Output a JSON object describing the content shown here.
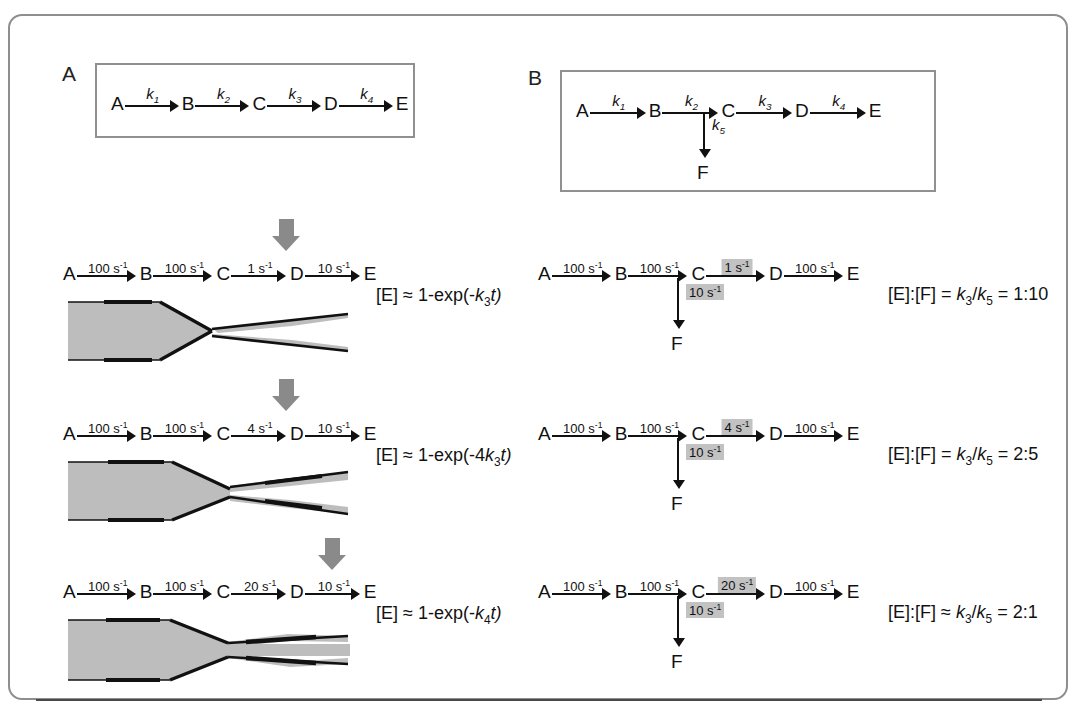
{
  "figure": {
    "panels": [
      {
        "letter": "A",
        "scheme": {
          "species": [
            "A",
            "B",
            "C",
            "D",
            "E"
          ],
          "rates": [
            "k1",
            "k2",
            "k3",
            "k4"
          ],
          "rate_labels": [
            "k",
            "k",
            "k",
            "k"
          ],
          "rate_subs": [
            "1",
            "2",
            "3",
            "4"
          ]
        },
        "rows": [
          {
            "rates": [
              "100 s",
              "100 s",
              "1 s",
              "10 s"
            ],
            "exponent": "-1",
            "species": [
              "A",
              "B",
              "C",
              "D",
              "E"
            ],
            "highlight_index": 2,
            "equation_prefix": "[E] ≈ 1-exp(-",
            "equation_k": "k",
            "equation_sub": "3",
            "equation_suffix": "t)"
          },
          {
            "rates": [
              "100 s",
              "100 s",
              "4 s",
              "10 s"
            ],
            "exponent": "-1",
            "species": [
              "A",
              "B",
              "C",
              "D",
              "E"
            ],
            "highlight_index": 2,
            "equation_prefix": "[E] ≈ 1-exp(-4",
            "equation_k": "k",
            "equation_sub": "3",
            "equation_suffix": "t)"
          },
          {
            "rates": [
              "100 s",
              "100 s",
              "20 s",
              "10 s"
            ],
            "exponent": "-1",
            "species": [
              "A",
              "B",
              "C",
              "D",
              "E"
            ],
            "highlight_index": 3,
            "equation_prefix": "[E] ≈ 1-exp(-",
            "equation_k": "k",
            "equation_sub": "4",
            "equation_suffix": "t)"
          }
        ]
      },
      {
        "letter": "B",
        "scheme": {
          "species": [
            "A",
            "B",
            "C",
            "D",
            "E"
          ],
          "branch_species": "F",
          "rate_labels": [
            "k",
            "k",
            "k",
            "k"
          ],
          "rate_subs": [
            "1",
            "2",
            "3",
            "4"
          ],
          "branch_label": "k",
          "branch_sub": "5"
        },
        "rows": [
          {
            "rates": [
              "100 s",
              "100 s",
              "1 s",
              "100 s"
            ],
            "exponent": "-1",
            "species": [
              "A",
              "B",
              "C",
              "D",
              "E"
            ],
            "branch_species": "F",
            "branch_rate": "10 s",
            "highlight_index": 2,
            "ratio": "[E]:[F] = k3/k5 = 1:10",
            "ratio_parts": {
              "lhs": "[E]:[F] ",
              "rel": "= ",
              "k_a": "k",
              "sub_a": "3",
              "slash": "/",
              "k_b": "k",
              "sub_b": "5",
              "result": " = 1:10"
            }
          },
          {
            "rates": [
              "100 s",
              "100 s",
              "4 s",
              "100 s"
            ],
            "exponent": "-1",
            "species": [
              "A",
              "B",
              "C",
              "D",
              "E"
            ],
            "branch_species": "F",
            "branch_rate": "10 s",
            "highlight_index": 2,
            "ratio": "[E]:[F] = k3/k5 = 2:5",
            "ratio_parts": {
              "lhs": "[E]:[F] ",
              "rel": "= ",
              "k_a": "k",
              "sub_a": "3",
              "slash": "/",
              "k_b": "k",
              "sub_b": "5",
              "result": " = 2:5"
            }
          },
          {
            "rates": [
              "100 s",
              "100 s",
              "20 s",
              "100 s"
            ],
            "exponent": "-1",
            "species": [
              "A",
              "B",
              "C",
              "D",
              "E"
            ],
            "branch_species": "F",
            "branch_rate": "10 s",
            "highlight_index": 2,
            "ratio": "[E]:[F] ≈ k3/k5 = 2:1",
            "ratio_parts": {
              "lhs": "[E]:[F] ",
              "rel": "≈ ",
              "k_a": "k",
              "sub_a": "3",
              "slash": "/",
              "k_b": "k",
              "sub_b": "5",
              "result": " = 2:1"
            }
          }
        ]
      }
    ],
    "colors": {
      "frame": "#8e8e8e",
      "box_border": "#909090",
      "highlight": "#c2c2c2",
      "gray_arrow": "#8a8a8a",
      "funnel_fill": "#bdbdbd",
      "funnel_edge": "#111111",
      "text": "#1a1a1a"
    }
  }
}
